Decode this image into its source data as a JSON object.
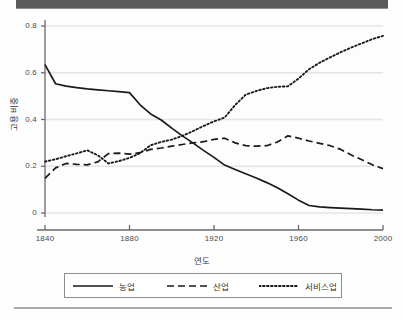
{
  "page": {
    "top_bar_color": "#5b5b5b",
    "background_color": "#fdfdfd",
    "rule_color": "#a9a9a9"
  },
  "chart_data": {
    "type": "line",
    "title": "",
    "xlabel": "연도",
    "ylabel": "고용 비중",
    "xlim": [
      1840,
      2000
    ],
    "ylim": [
      0,
      0.8
    ],
    "grid": true,
    "grid_axis": "y",
    "legend_position": "bottom",
    "xticks": [
      1840,
      1880,
      1920,
      1960,
      2000
    ],
    "xtick_labels": [
      "1840",
      "1880",
      "1920",
      "1960",
      "2000"
    ],
    "yticks": [
      0,
      0.2,
      0.4,
      0.6,
      0.8
    ],
    "ytick_labels": [
      "0",
      "0.2",
      "0.4",
      "0.6",
      "0.8"
    ],
    "x": [
      1840,
      1845,
      1850,
      1855,
      1860,
      1865,
      1870,
      1875,
      1880,
      1885,
      1890,
      1895,
      1900,
      1905,
      1910,
      1915,
      1920,
      1925,
      1930,
      1935,
      1940,
      1945,
      1950,
      1955,
      1960,
      1965,
      1970,
      1975,
      1980,
      1985,
      1990,
      1995,
      2000
    ],
    "series": [
      {
        "name": "농업",
        "style": "solid",
        "color": "#1a1a1a",
        "values": [
          0.635,
          0.553,
          0.543,
          0.536,
          0.531,
          0.527,
          0.523,
          0.519,
          0.515,
          0.463,
          0.424,
          0.398,
          0.363,
          0.33,
          0.3,
          0.268,
          0.238,
          0.205,
          0.186,
          0.168,
          0.15,
          0.13,
          0.108,
          0.082,
          0.055,
          0.032,
          0.026,
          0.023,
          0.021,
          0.019,
          0.017,
          0.014,
          0.012
        ]
      },
      {
        "name": "산업",
        "style": "dashed",
        "color": "#1a1a1a",
        "values": [
          0.148,
          0.193,
          0.212,
          0.208,
          0.206,
          0.219,
          0.254,
          0.256,
          0.252,
          0.258,
          0.272,
          0.278,
          0.286,
          0.293,
          0.3,
          0.305,
          0.315,
          0.32,
          0.3,
          0.288,
          0.286,
          0.288,
          0.304,
          0.33,
          0.32,
          0.308,
          0.298,
          0.288,
          0.272,
          0.248,
          0.228,
          0.206,
          0.19
        ]
      },
      {
        "name": "서비스업",
        "style": "dotted",
        "color": "#1a1a1a",
        "values": [
          0.22,
          0.23,
          0.243,
          0.255,
          0.268,
          0.247,
          0.212,
          0.222,
          0.236,
          0.256,
          0.29,
          0.304,
          0.314,
          0.33,
          0.35,
          0.372,
          0.392,
          0.408,
          0.462,
          0.506,
          0.522,
          0.534,
          0.54,
          0.542,
          0.575,
          0.615,
          0.643,
          0.666,
          0.688,
          0.708,
          0.726,
          0.744,
          0.758
        ]
      }
    ]
  },
  "legend": {
    "entries": [
      {
        "label": "농업",
        "style": "solid"
      },
      {
        "label": "산업",
        "style": "dashed"
      },
      {
        "label": "서비스업",
        "style": "dotted"
      }
    ]
  }
}
